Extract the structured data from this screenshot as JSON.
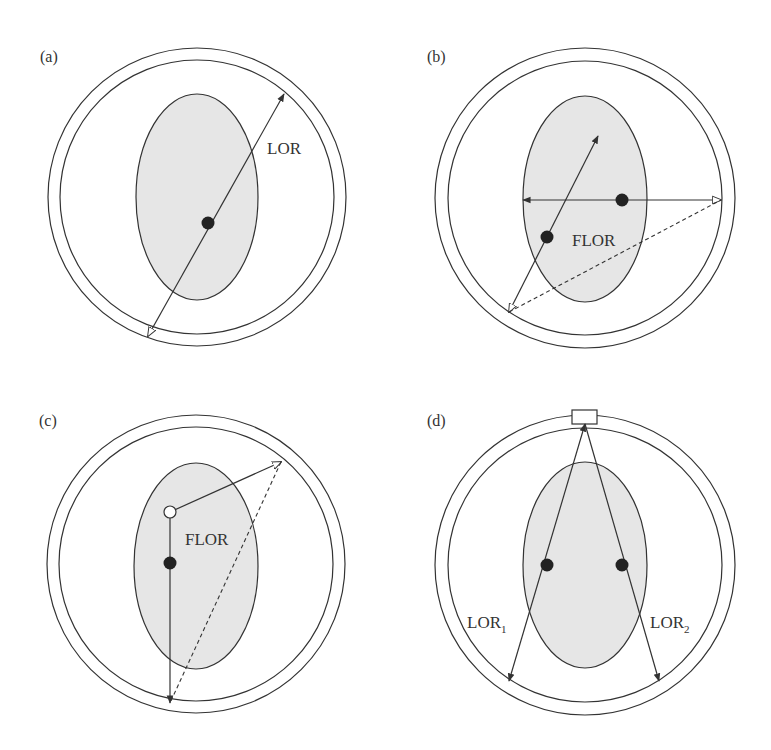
{
  "figure": {
    "panels": [
      {
        "id": "a",
        "label": "(a)",
        "annotations": [
          "LOR"
        ]
      },
      {
        "id": "b",
        "label": "(b)",
        "annotations": [
          "FLOR"
        ]
      },
      {
        "id": "c",
        "label": "(c)",
        "annotations": [
          "FLOR"
        ]
      },
      {
        "id": "d",
        "label": "(d)",
        "annotations": [
          "LOR",
          "1",
          "LOR",
          "2"
        ]
      }
    ],
    "colors": {
      "stroke": "#333333",
      "phantom_fill": "#e6e6e6",
      "background": "#ffffff"
    }
  }
}
